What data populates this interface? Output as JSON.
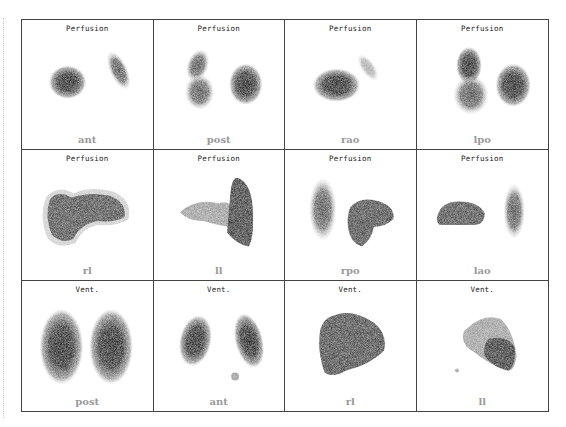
{
  "figure": {
    "layout": {
      "rows": 3,
      "cols": 4
    },
    "panels": [
      {
        "title": "Perfusion",
        "label": "ant",
        "shape": "ant"
      },
      {
        "title": "Perfusion",
        "label": "post",
        "shape": "post"
      },
      {
        "title": "Perfusion",
        "label": "rao",
        "shape": "rao"
      },
      {
        "title": "Perfusion",
        "label": "lpo",
        "shape": "lpo"
      },
      {
        "title": "Perfusion",
        "label": "rl",
        "shape": "rl"
      },
      {
        "title": "Perfusion",
        "label": "ll",
        "shape": "ll"
      },
      {
        "title": "Perfusion",
        "label": "rpo",
        "shape": "rpo"
      },
      {
        "title": "Perfusion",
        "label": "lao",
        "shape": "lao"
      },
      {
        "title": "Vent.",
        "label": "post",
        "shape": "vpost"
      },
      {
        "title": "Vent.",
        "label": "ant",
        "shape": "vant"
      },
      {
        "title": "Vent.",
        "label": "rl",
        "shape": "vrl"
      },
      {
        "title": "Vent.",
        "label": "ll",
        "shape": "vll"
      }
    ],
    "colors": {
      "border": "#444444",
      "uptake_dark": "#3a3a3a",
      "uptake_light": "#9a9a9a",
      "label": "#9a9a9a"
    }
  }
}
